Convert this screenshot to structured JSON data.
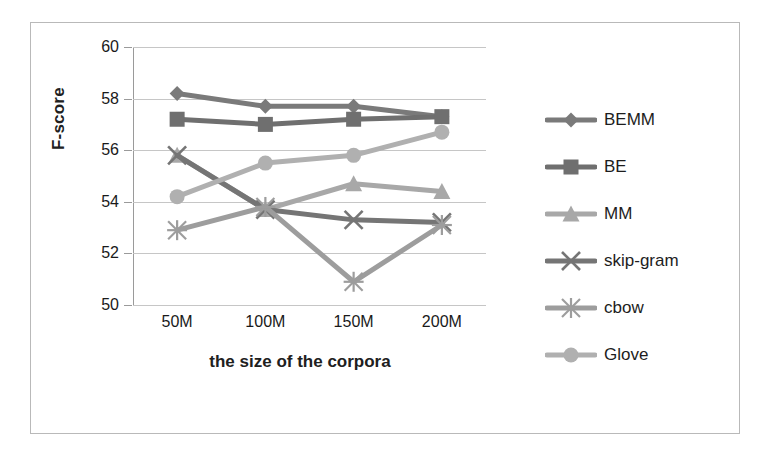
{
  "chart_data": {
    "type": "line",
    "title": "",
    "xlabel": "the size of the corpora",
    "ylabel": "F-score",
    "categories": [
      "50M",
      "100M",
      "150M",
      "200M"
    ],
    "ylim": [
      50,
      60
    ],
    "yticks": [
      50,
      52,
      54,
      56,
      58,
      60
    ],
    "grid": true,
    "legend_position": "right",
    "series": [
      {
        "name": "BEMM",
        "marker": "diamond",
        "color": "#7a7a7a",
        "values": [
          58.2,
          57.7,
          57.7,
          57.3
        ]
      },
      {
        "name": "BE",
        "marker": "square",
        "color": "#6f6f6f",
        "values": [
          57.2,
          57.0,
          57.2,
          57.3
        ]
      },
      {
        "name": "MM",
        "marker": "triangle",
        "color": "#a8a8a8",
        "values": [
          55.8,
          53.7,
          54.7,
          54.4
        ]
      },
      {
        "name": "skip-gram",
        "marker": "x",
        "color": "#757575",
        "values": [
          55.8,
          53.7,
          53.3,
          53.2
        ]
      },
      {
        "name": "cbow",
        "marker": "asterisk",
        "color": "#9d9d9d",
        "values": [
          52.9,
          53.8,
          50.9,
          53.1
        ]
      },
      {
        "name": "Glove",
        "marker": "circle",
        "color": "#b0b0b0",
        "values": [
          54.2,
          55.5,
          55.8,
          56.7
        ]
      }
    ]
  },
  "axes": {
    "y_tick_labels": [
      "60",
      "58",
      "56",
      "54",
      "52",
      "50"
    ],
    "x_tick_labels": [
      "50M",
      "100M",
      "150M",
      "200M"
    ],
    "y_title": "F-score",
    "x_title": "the size of the corpora"
  },
  "legend": {
    "items": [
      {
        "label": "BEMM"
      },
      {
        "label": "BE"
      },
      {
        "label": "MM"
      },
      {
        "label": "skip-gram"
      },
      {
        "label": "cbow"
      },
      {
        "label": "Glove"
      }
    ]
  },
  "colors": {
    "gridline": "#c6c6c6",
    "axis": "#9a9a9a",
    "frame": "#b9b9b9",
    "text": "#1a1a1a",
    "background": "#ffffff"
  }
}
